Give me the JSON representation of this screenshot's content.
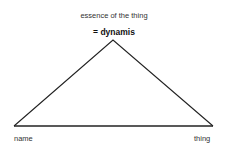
{
  "diagram": {
    "apex_label": "essence of the thing",
    "apex_sublabel": "= dynamis",
    "left_label": "name",
    "right_label": "thing",
    "shape": "triangle",
    "line_color": "#222222"
  }
}
